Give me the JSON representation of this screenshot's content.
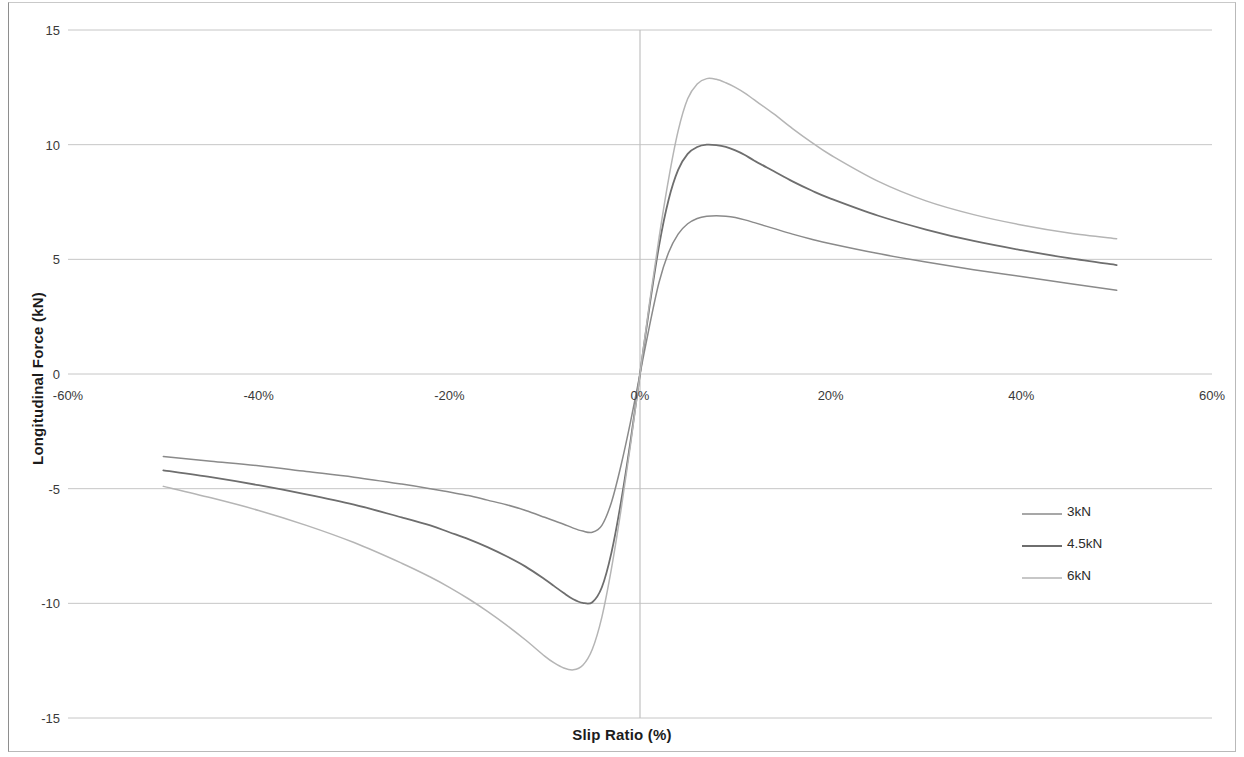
{
  "chart_data": {
    "type": "line",
    "title": "",
    "xlabel": "Slip Ratio (%)",
    "ylabel": "Longitudinal Force (kN)",
    "xlim": [
      -60,
      60
    ],
    "ylim": [
      -15,
      15
    ],
    "xticks": [
      "-60%",
      "-40%",
      "-20%",
      "0%",
      "20%",
      "40%",
      "60%"
    ],
    "xtick_values": [
      -60,
      -40,
      -20,
      0,
      20,
      40,
      60
    ],
    "yticks": [
      "-15",
      "-10",
      "-5",
      "0",
      "5",
      "10",
      "15"
    ],
    "ytick_values": [
      -15,
      -10,
      -5,
      0,
      5,
      10,
      15
    ],
    "grid": true,
    "grid_axis": "y",
    "legend_position": "center-right",
    "legend": [
      "3kN",
      "4.5kN",
      "6kN"
    ],
    "series": [
      {
        "name": "3kN",
        "color": "#8a8a8a",
        "width": 1.5,
        "x": [
          -50,
          -45,
          -40,
          -35,
          -30,
          -25,
          -22,
          -20,
          -18,
          -16,
          -14,
          -12,
          -10,
          -9,
          -8,
          -7,
          -6,
          -5,
          -4,
          -3,
          -2,
          -1,
          0,
          1,
          2,
          3,
          4,
          5,
          6,
          7,
          8,
          9,
          10,
          11,
          12,
          14,
          16,
          18,
          20,
          25,
          30,
          35,
          40,
          45,
          50
        ],
        "y": [
          -3.6,
          -3.8,
          -4.0,
          -4.25,
          -4.5,
          -4.8,
          -5.0,
          -5.15,
          -5.3,
          -5.5,
          -5.7,
          -5.95,
          -6.25,
          -6.4,
          -6.55,
          -6.72,
          -6.85,
          -6.9,
          -6.6,
          -5.6,
          -4.0,
          -2.1,
          0,
          2.1,
          4.0,
          5.3,
          6.1,
          6.55,
          6.78,
          6.88,
          6.9,
          6.88,
          6.82,
          6.72,
          6.6,
          6.35,
          6.1,
          5.88,
          5.68,
          5.25,
          4.88,
          4.55,
          4.25,
          3.95,
          3.65
        ]
      },
      {
        "name": "4.5kN",
        "color": "#6e6e6e",
        "width": 1.8,
        "x": [
          -50,
          -45,
          -40,
          -35,
          -30,
          -25,
          -22,
          -20,
          -18,
          -16,
          -14,
          -12,
          -10,
          -9,
          -8,
          -7,
          -6,
          -5,
          -4,
          -3,
          -2,
          -1,
          0,
          1,
          2,
          3,
          4,
          5,
          6,
          7,
          8,
          9,
          10,
          11,
          12,
          14,
          16,
          18,
          20,
          25,
          30,
          35,
          40,
          45,
          50
        ],
        "y": [
          -4.2,
          -4.5,
          -4.85,
          -5.25,
          -5.7,
          -6.25,
          -6.6,
          -6.9,
          -7.2,
          -7.55,
          -7.95,
          -8.4,
          -8.95,
          -9.25,
          -9.55,
          -9.82,
          -9.98,
          -9.95,
          -9.3,
          -7.8,
          -5.6,
          -2.95,
          0,
          2.95,
          5.6,
          7.6,
          8.9,
          9.6,
          9.9,
          10.0,
          9.98,
          9.9,
          9.75,
          9.55,
          9.3,
          8.85,
          8.4,
          8.0,
          7.65,
          6.9,
          6.3,
          5.8,
          5.4,
          5.05,
          4.75
        ]
      },
      {
        "name": "6kN",
        "color": "#b5b5b5",
        "width": 1.5,
        "x": [
          -50,
          -45,
          -40,
          -35,
          -30,
          -25,
          -22,
          -20,
          -18,
          -16,
          -14,
          -12,
          -10,
          -9,
          -8,
          -7,
          -6,
          -5,
          -4,
          -3,
          -2,
          -1,
          0,
          1,
          2,
          3,
          4,
          5,
          6,
          7,
          8,
          9,
          10,
          11,
          12,
          14,
          16,
          18,
          20,
          25,
          30,
          35,
          40,
          45,
          50
        ],
        "y": [
          -4.9,
          -5.4,
          -5.95,
          -6.6,
          -7.35,
          -8.25,
          -8.85,
          -9.3,
          -9.8,
          -10.35,
          -10.95,
          -11.6,
          -12.3,
          -12.6,
          -12.82,
          -12.9,
          -12.7,
          -12.0,
          -10.6,
          -8.5,
          -5.95,
          -3.1,
          0,
          3.1,
          5.95,
          8.5,
          10.6,
          12.0,
          12.65,
          12.88,
          12.85,
          12.7,
          12.5,
          12.25,
          11.95,
          11.35,
          10.7,
          10.1,
          9.55,
          8.4,
          7.55,
          6.95,
          6.5,
          6.15,
          5.9
        ]
      }
    ]
  },
  "axis": {
    "y_title": "Longitudinal Force (kN)",
    "x_title": "Slip Ratio (%)"
  }
}
